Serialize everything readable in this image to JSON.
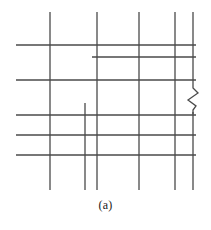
{
  "figure": {
    "caption": "(a)",
    "type": "line-network-diagram",
    "stroke_color": "#4a4a4a",
    "background_color": "#ffffff",
    "stroke_width": 1.3,
    "canvas": {
      "width": 211,
      "height": 230
    },
    "drawing_bounds": {
      "x_min": 16,
      "x_max": 196,
      "y_min": 12,
      "y_max": 190
    },
    "vertical_lines": [
      {
        "name": "vertical-line-1",
        "x": 50,
        "y1": 12,
        "y2": 190
      },
      {
        "name": "vertical-line-2",
        "x": 97,
        "y1": 12,
        "y2": 190
      },
      {
        "name": "vertical-line-3",
        "x": 139,
        "y1": 12,
        "y2": 190
      },
      {
        "name": "vertical-line-4",
        "x": 175,
        "y1": 12,
        "y2": 190
      },
      {
        "name": "vertical-line-5",
        "x": 193,
        "y1": 12,
        "y2": 190
      }
    ],
    "vertical_stubs": [
      {
        "name": "vertical-stub-short",
        "x": 85,
        "y1": 103,
        "y2": 190
      }
    ],
    "horizontal_lines": [
      {
        "name": "horizontal-line-1",
        "y": 45,
        "x1": 16,
        "x2": 196
      },
      {
        "name": "horizontal-line-2",
        "y": 80,
        "x1": 16,
        "x2": 196
      },
      {
        "name": "horizontal-line-3",
        "y": 115,
        "x1": 16,
        "x2": 196
      },
      {
        "name": "horizontal-line-4",
        "y": 135,
        "x1": 16,
        "x2": 196
      },
      {
        "name": "horizontal-line-5",
        "y": 155,
        "x1": 16,
        "x2": 196
      }
    ],
    "horizontal_stubs": [
      {
        "name": "horizontal-stub-short",
        "y": 57,
        "x1": 92,
        "x2": 196
      }
    ],
    "break_symbol": {
      "name": "zigzag-break",
      "on_line": "vertical-line-5",
      "x": 193,
      "y_top": 84,
      "y_bottom": 112,
      "amplitude": 5,
      "points": "193,84 193,88 198,93 188,100 196,106 193,110 193,114"
    }
  }
}
